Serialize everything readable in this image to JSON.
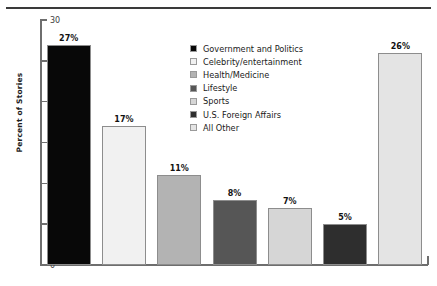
{
  "chart_data": {
    "type": "bar",
    "title": "",
    "xlabel": "",
    "ylabel": "Percent of Stories",
    "ylim": [
      0,
      30
    ],
    "yticks": [
      0,
      5,
      10,
      15,
      20,
      25,
      30
    ],
    "ytick_labels": [
      "0",
      "5",
      "10",
      "15",
      "20",
      "25",
      "30"
    ],
    "grid": false,
    "legend_position": "upper-right-inside",
    "value_suffix": "%",
    "categories": [
      "Government and Politics",
      "Celebrity/entertainment",
      "Health/Medicine",
      "Lifestyle",
      "Sports",
      "U.S. Foreign Affairs",
      "All Other"
    ],
    "values": [
      27,
      17,
      11,
      8,
      7,
      5,
      26
    ],
    "value_labels": [
      "27%",
      "17%",
      "11%",
      "8%",
      "7%",
      "5%",
      "26%"
    ],
    "colors": [
      "#080808",
      "#f1f1f1",
      "#b3b3b3",
      "#565656",
      "#d6d6d6",
      "#2e2e2e",
      "#e4e4e4"
    ],
    "bar_border_color": "#8d8d8d",
    "axis_color": "#6e6e6e",
    "text_color": "#1a1a1a"
  },
  "legend": {
    "items": [
      {
        "label": "Government and Politics",
        "color": "#080808"
      },
      {
        "label": "Celebrity/entertainment",
        "color": "#f1f1f1"
      },
      {
        "label": "Health/Medicine",
        "color": "#b3b3b3"
      },
      {
        "label": "Lifestyle",
        "color": "#565656"
      },
      {
        "label": "Sports",
        "color": "#d6d6d6"
      },
      {
        "label": "U.S. Foreign Affairs",
        "color": "#2e2e2e"
      },
      {
        "label": "All Other",
        "color": "#e4e4e4"
      }
    ]
  }
}
